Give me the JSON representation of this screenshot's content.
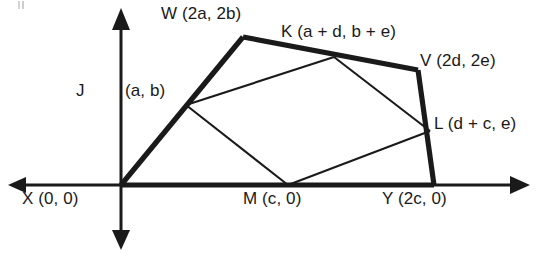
{
  "figure": {
    "axes": {
      "x_axis_name": "horizontal axis",
      "y_axis_name": "vertical axis",
      "arrowheads": "both ends on each axis"
    },
    "points": {
      "X": {
        "label": "X (0, 0)"
      },
      "W": {
        "label": "W (2a, 2b)"
      },
      "K": {
        "label": "K (a + d, b + e)"
      },
      "V": {
        "label": "V (2d, 2e)"
      },
      "L": {
        "label": "L (d + c, e)"
      },
      "Y": {
        "label": "Y (2c, 0)"
      },
      "M": {
        "label": "M (c, 0)"
      },
      "J_name": "J",
      "J_coords": "(a, b)"
    },
    "colors": {
      "stroke": "#1a1a1a",
      "background": "#ffffff"
    }
  }
}
